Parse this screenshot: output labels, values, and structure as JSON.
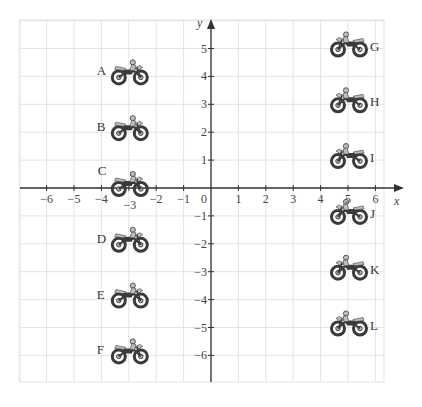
{
  "diagram": {
    "type": "coordinate-grid",
    "axes": {
      "x_label": "x",
      "y_label": "y",
      "x_ticks": [
        "−6",
        "−5",
        "−4",
        "−3",
        "−2",
        "−1",
        "0",
        "1",
        "2",
        "3",
        "4",
        "5",
        "6"
      ],
      "y_ticks": [
        "5",
        "4",
        "3",
        "2",
        "1",
        "−1",
        "−2",
        "−3",
        "−4",
        "−5",
        "−6"
      ],
      "x_range": [
        -7,
        6.5
      ],
      "y_range": [
        -7,
        6
      ]
    },
    "colors": {
      "grid": "#e3e3e3",
      "axis": "#333333",
      "text": "#444444",
      "bike_dark": "#3a3a3a",
      "bike_light": "#bdbdbd"
    },
    "motorcycles": [
      {
        "label": "A",
        "x": -3,
        "y": 4,
        "label_side": "left"
      },
      {
        "label": "B",
        "x": -3,
        "y": 2,
        "label_side": "left"
      },
      {
        "label": "C",
        "x": -3,
        "y": 0,
        "label_side": "left-above"
      },
      {
        "label": "D",
        "x": -3,
        "y": -2,
        "label_side": "left"
      },
      {
        "label": "E",
        "x": -3,
        "y": -4,
        "label_side": "left"
      },
      {
        "label": "F",
        "x": -3,
        "y": -6,
        "label_side": "left"
      },
      {
        "label": "G",
        "x": 5,
        "y": 5,
        "label_side": "right"
      },
      {
        "label": "H",
        "x": 5,
        "y": 3,
        "label_side": "right"
      },
      {
        "label": "I",
        "x": 5,
        "y": 1,
        "label_side": "right"
      },
      {
        "label": "J",
        "x": 5,
        "y": -1,
        "label_side": "right"
      },
      {
        "label": "K",
        "x": 5,
        "y": -3,
        "label_side": "right"
      },
      {
        "label": "L",
        "x": 5,
        "y": -5,
        "label_side": "right"
      }
    ]
  }
}
